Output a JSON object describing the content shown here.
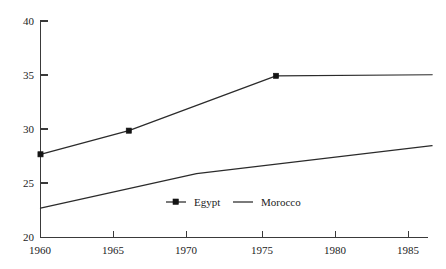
{
  "chart_data": {
    "type": "line",
    "title": "",
    "subtitle": "",
    "xlabel": "",
    "ylabel": "",
    "xlim": [
      1960,
      1986.6
    ],
    "ylim": [
      20,
      40
    ],
    "grid": false,
    "legend_position": "inside-bottom-center",
    "x_ticks": [
      "1960",
      "1965",
      "1970",
      "1975",
      "1980",
      "1985"
    ],
    "x_tick_values": [
      1960,
      1965,
      1970,
      1975,
      1980,
      1985
    ],
    "y_ticks": [
      "20",
      "25",
      "30",
      "35",
      "40"
    ],
    "y_tick_values": [
      20,
      25,
      30,
      35,
      40
    ],
    "series": [
      {
        "name": "Egypt",
        "marker": "square",
        "has_markers": true,
        "x": [
          1960,
          1966,
          1976,
          1986.6
        ],
        "values": [
          27.6,
          29.8,
          34.9,
          35.0
        ],
        "marker_x": [
          1960,
          1966,
          1976
        ],
        "marker_values": [
          27.6,
          29.8,
          34.9
        ]
      },
      {
        "name": "Morocco",
        "marker": "none",
        "has_markers": false,
        "x": [
          1960,
          1970.6,
          1986.6
        ],
        "values": [
          22.6,
          25.8,
          28.4
        ],
        "marker_x": [],
        "marker_values": []
      }
    ],
    "colors": {
      "series_egypt": "#2b2b2b",
      "series_morocco": "#2b2b2b",
      "axis": "#3a3a3a",
      "text": "#1c1c1c",
      "background": "#ffffff"
    }
  },
  "legend": {
    "entries": [
      {
        "label": "Egypt"
      },
      {
        "label": "Morocco"
      }
    ]
  },
  "axes": {
    "y_axis_name": "y-axis",
    "x_axis_name": "x-axis"
  }
}
